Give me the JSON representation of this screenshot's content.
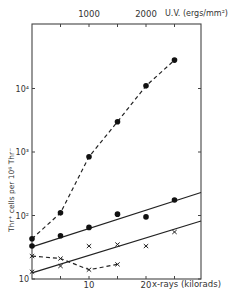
{
  "chart_data": {
    "type": "scatter",
    "title": "",
    "xlabel": "x-rays (kilorads)",
    "x2label": "U.V. (ergs/mm²)",
    "ylabel": "Thr⁺ cells per 10⁶ Thr⁻",
    "yscale": "log",
    "ylim": [
      10,
      50000
    ],
    "xlim": [
      0,
      30
    ],
    "x2lim": [
      0,
      3000
    ],
    "grid": false,
    "x_ticks": [
      0,
      5,
      10,
      15,
      20,
      25
    ],
    "x_tick_labels": [
      "10",
      "20"
    ],
    "x_tick_label_positions": [
      10,
      20
    ],
    "x2_ticks": [
      500,
      1000,
      1500,
      2000,
      2500
    ],
    "x2_tick_labels": [
      "1000",
      "2000"
    ],
    "x2_tick_label_positions": [
      1000,
      2000
    ],
    "y_ticks": [
      10,
      100,
      1000,
      10000
    ],
    "y_tick_labels": [
      "10",
      "10²",
      "10³",
      "10⁴"
    ],
    "series": [
      {
        "name": "U.V. (filled circles, dashed)",
        "marker": "circle",
        "line": "dashed",
        "axis": "top",
        "x": [
          0,
          500,
          1000,
          1500,
          2000,
          2500
        ],
        "y": [
          43,
          110,
          840,
          3000,
          11000,
          28000
        ]
      },
      {
        "name": "x-rays (filled circles, solid fit)",
        "marker": "circle",
        "line": "solid-fit",
        "axis": "bottom",
        "x": [
          0,
          5,
          10,
          15,
          20,
          25
        ],
        "y": [
          33,
          48,
          65,
          105,
          95,
          175
        ],
        "fit": {
          "x": [
            0,
            30
          ],
          "y": [
            32,
            230
          ]
        }
      },
      {
        "name": "x-rays (crosses, solid fit)",
        "marker": "cross",
        "line": "solid-fit",
        "axis": "bottom",
        "x": [
          0,
          5,
          10,
          15,
          20,
          25
        ],
        "y": [
          13,
          16,
          33,
          35,
          33,
          55
        ],
        "fit": {
          "x": [
            0,
            30
          ],
          "y": [
            12.5,
            82
          ]
        }
      },
      {
        "name": "crosses (dashed)",
        "marker": "cross",
        "line": "dashed",
        "axis": "bottom",
        "x": [
          0,
          5,
          10,
          15
        ],
        "y": [
          23,
          21,
          14,
          17
        ]
      }
    ]
  }
}
